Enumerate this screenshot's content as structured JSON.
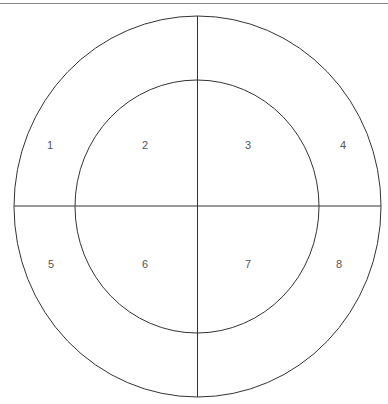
{
  "diagram": {
    "regions": [
      {
        "label": "1",
        "x": 50,
        "y": 145
      },
      {
        "label": "2",
        "x": 145,
        "y": 145
      },
      {
        "label": "3",
        "x": 248,
        "y": 145
      },
      {
        "label": "4",
        "x": 343,
        "y": 145
      },
      {
        "label": "5",
        "x": 51,
        "y": 264
      },
      {
        "label": "6",
        "x": 145,
        "y": 264
      },
      {
        "label": "7",
        "x": 248,
        "y": 264
      },
      {
        "label": "8",
        "x": 339,
        "y": 264
      }
    ],
    "line_color": "#333333"
  }
}
